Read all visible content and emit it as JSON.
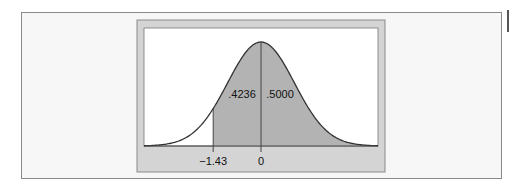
{
  "chart_data": {
    "type": "area",
    "title": "",
    "xlabel": "",
    "ylabel": "",
    "distribution": "standard normal",
    "xlim": [
      -3.5,
      3.5
    ],
    "shaded_from": -1.43,
    "shaded_to": "infinity",
    "tick_labels": [
      {
        "x": -1.43,
        "label": "−1.43"
      },
      {
        "x": 0,
        "label": "0"
      }
    ],
    "region_labels": [
      {
        "region": "between -1.43 and 0",
        "value": 0.4236,
        "label": ".4236"
      },
      {
        "region": "above 0",
        "value": 0.5,
        "label": ".5000"
      }
    ],
    "colors": {
      "frame_bg": "#d4d4d4",
      "plot_bg": "#ffffff",
      "shade": "#b3b3b3",
      "curve": "#333333"
    }
  }
}
